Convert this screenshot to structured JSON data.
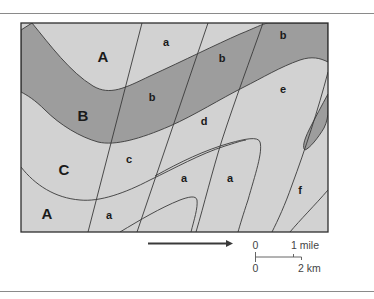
{
  "figure": {
    "type": "geologic-map",
    "colors": {
      "light_unit": "#d2d2d2",
      "dark_unit": "#9d9d9d",
      "line": "#3a3a3a",
      "frame": "#2e2e2e",
      "rule": "#8a8a8a",
      "text": "#1a1a1a"
    },
    "formation_labels": [
      {
        "id": "A-top",
        "text": "A",
        "x": 103,
        "y": 62
      },
      {
        "id": "B",
        "text": "B",
        "x": 83,
        "y": 121
      },
      {
        "id": "C",
        "text": "C",
        "x": 64,
        "y": 175
      },
      {
        "id": "A-bottom",
        "text": "A",
        "x": 47,
        "y": 219
      }
    ],
    "unit_labels": [
      {
        "id": "a-top",
        "text": "a",
        "x": 166,
        "y": 46
      },
      {
        "id": "b-1",
        "text": "b",
        "x": 222,
        "y": 62
      },
      {
        "id": "b-2",
        "text": "b",
        "x": 283,
        "y": 39
      },
      {
        "id": "b-3",
        "text": "b",
        "x": 152,
        "y": 101
      },
      {
        "id": "d",
        "text": "d",
        "x": 204,
        "y": 125
      },
      {
        "id": "e",
        "text": "e",
        "x": 283,
        "y": 93
      },
      {
        "id": "c",
        "text": "c",
        "x": 129,
        "y": 163
      },
      {
        "id": "a-mid-1",
        "text": "a",
        "x": 184,
        "y": 182
      },
      {
        "id": "a-mid-2",
        "text": "a",
        "x": 230,
        "y": 182
      },
      {
        "id": "f",
        "text": "f",
        "x": 300,
        "y": 194
      },
      {
        "id": "a-bottom",
        "text": "a",
        "x": 109,
        "y": 219
      }
    ],
    "direction_arrow": {
      "label": ""
    },
    "scale_bar": {
      "top_left": "0",
      "top_right": "1 mile",
      "bottom_left": "0",
      "bottom_right": "2 km"
    }
  }
}
